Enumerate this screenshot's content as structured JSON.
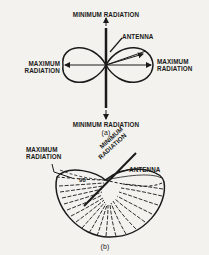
{
  "figure_a": {
    "top_label": "MINIMUM RADIATION",
    "bottom_label": "MINIMUM RADIATION",
    "antenna_label": "ANTENNA",
    "left_label_line1": "MAXIMUM",
    "left_label_line2": "RADIATION",
    "right_label_line1": "MAXIMUM",
    "right_label_line2": "RADIATION",
    "caption": "(a)"
  },
  "figure_b": {
    "max_label_line1": "MAXIMUM",
    "max_label_line2": "RADIATION",
    "min_label_line1": "MINIMUM",
    "min_label_line2": "RADIATION",
    "antenna_label": "ANTENNA",
    "angle_label": "90°",
    "caption": "(b)"
  },
  "colors": {
    "background": "#f3f2ee",
    "ink": "#1a1a1a"
  }
}
